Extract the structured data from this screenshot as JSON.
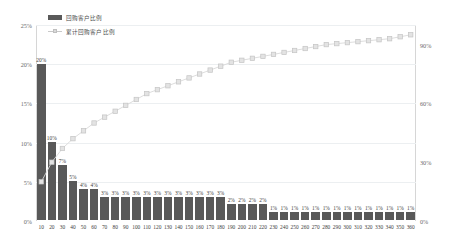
{
  "legend": {
    "items": [
      {
        "label": "回购客户比例",
        "marker": "bar-swatch",
        "color": "#595959"
      },
      {
        "label": "累计回购客户比例",
        "marker": "line-square-marker",
        "color": "#d9d9d9"
      }
    ]
  },
  "axes": {
    "left_ticks": [
      "25%",
      "20%",
      "15%",
      "10%",
      "5%",
      "0%"
    ],
    "right_ticks": [
      "90%",
      "60%",
      "30%",
      "0%"
    ]
  },
  "chart_data": {
    "type": "bar",
    "title": "",
    "subtitle": "",
    "xlabel": "",
    "ylabel": "",
    "grid": true,
    "legend_position": "top-left",
    "categories": [
      "10",
      "20",
      "30",
      "40",
      "50",
      "60",
      "70",
      "80",
      "90",
      "100",
      "110",
      "120",
      "130",
      "140",
      "150",
      "160",
      "170",
      "180",
      "190",
      "200",
      "210",
      "220",
      "230",
      "240",
      "250",
      "260",
      "270",
      "280",
      "290",
      "300",
      "310",
      "320",
      "330",
      "340",
      "350",
      "360"
    ],
    "ylim": [
      0,
      25
    ],
    "y2lim": [
      0,
      100
    ],
    "yticks": [
      0,
      5,
      10,
      15,
      20,
      25
    ],
    "y2ticks": [
      0,
      30,
      60,
      90
    ],
    "series": [
      {
        "name": "回购客户比例",
        "type": "bar",
        "axis": "left",
        "color": "#595959",
        "values": [
          20,
          10,
          7,
          5,
          4,
          4,
          3,
          3,
          3,
          3,
          3,
          3,
          3,
          3,
          3,
          3,
          3,
          3,
          2,
          2,
          2,
          2,
          1,
          1,
          1,
          1,
          1,
          1,
          1,
          1,
          1,
          1,
          1,
          1,
          1,
          1
        ],
        "labels": [
          "20%",
          "10%",
          "7%",
          "5%",
          "4%",
          "4%",
          "3%",
          "3%",
          "3%",
          "3%",
          "3%",
          "3%",
          "3%",
          "3%",
          "3%",
          "3%",
          "3%",
          "3%",
          "2%",
          "2%",
          "2%",
          "2%",
          "1%",
          "1%",
          "1%",
          "1%",
          "1%",
          "1%",
          "1%",
          "1%",
          "1%",
          "1%",
          "1%",
          "1%",
          "1%",
          "1%"
        ]
      },
      {
        "name": "累计回购客户比例",
        "type": "line",
        "axis": "right",
        "color": "#d9d9d9",
        "marker": "square",
        "values": [
          20,
          30,
          37,
          42,
          46,
          50,
          53,
          56,
          59,
          62,
          65,
          67,
          69,
          71,
          73,
          75,
          77,
          79,
          81,
          82,
          83,
          84,
          85,
          86,
          87,
          88,
          89,
          90,
          90.5,
          91,
          91.5,
          92,
          92.5,
          93,
          94,
          95
        ]
      }
    ]
  }
}
